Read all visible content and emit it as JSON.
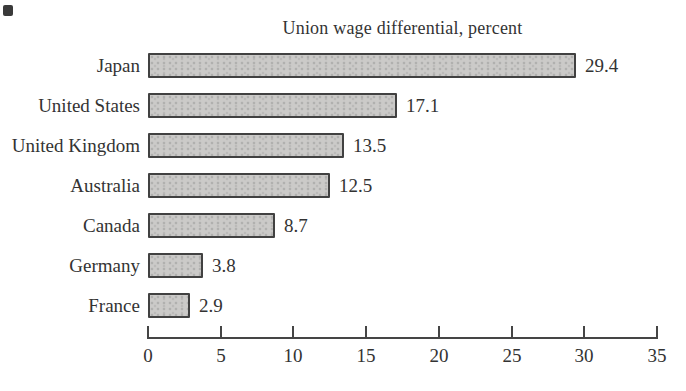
{
  "chart_data": {
    "type": "bar",
    "orientation": "horizontal",
    "title": "Union wage differential, percent",
    "categories": [
      "Japan",
      "United States",
      "United Kingdom",
      "Australia",
      "Canada",
      "Germany",
      "France"
    ],
    "values": [
      29.4,
      17.1,
      13.5,
      12.5,
      8.7,
      3.8,
      2.9
    ],
    "value_labels": [
      "29.4",
      "17.1",
      "13.5",
      "12.5",
      "8.7",
      "3.8",
      "2.9"
    ],
    "xlabel": "",
    "ylabel": "",
    "xlim": [
      0,
      35
    ],
    "xticks": [
      0,
      5,
      10,
      15,
      20,
      25,
      30,
      35
    ],
    "xtick_labels": [
      "0",
      "5",
      "10",
      "15",
      "20",
      "25",
      "30",
      "35"
    ],
    "grid": "off",
    "legend": "none",
    "bar_fill_color": "#cbcac8",
    "bar_border_color": "#414141",
    "axis_color": "#454545",
    "text_color": "#333333",
    "background_color": "#ffffff"
  }
}
